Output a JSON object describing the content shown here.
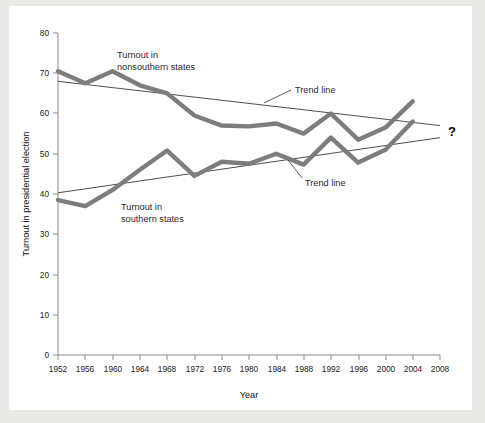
{
  "chart_data": {
    "type": "line",
    "title": "",
    "xlabel": "Year",
    "ylabel": "Turnout in presidential election",
    "x": [
      1952,
      1956,
      1960,
      1964,
      1968,
      1972,
      1976,
      1980,
      1984,
      1988,
      1992,
      1996,
      2000,
      2004
    ],
    "xlim": [
      1952,
      2008
    ],
    "ylim": [
      0,
      80
    ],
    "xticks": [
      "1952",
      "1956",
      "1960",
      "1964",
      "1968",
      "1972",
      "1976",
      "1980",
      "1984",
      "1988",
      "1992",
      "1996",
      "2000",
      "2004",
      "2008"
    ],
    "yticks": [
      "0",
      "10",
      "20",
      "30",
      "40",
      "50",
      "60",
      "70",
      "80"
    ],
    "grid": false,
    "legend": "none (inline annotations)",
    "series": [
      {
        "name": "Turnout in nonsouthern states",
        "color": "#7d7d7d",
        "values": [
          70.5,
          67.5,
          70.5,
          67.0,
          65.0,
          59.5,
          57.0,
          56.8,
          57.5,
          55.0,
          60.0,
          53.5,
          56.5,
          63.0
        ]
      },
      {
        "name": "Turnout in southern states",
        "color": "#7d7d7d",
        "values": [
          38.5,
          37.0,
          41.0,
          46.0,
          50.8,
          44.5,
          48.0,
          47.5,
          50.0,
          47.3,
          54.0,
          47.8,
          51.0,
          58.0
        ]
      }
    ],
    "trend_lines": [
      {
        "name": "Trend line (nonsouthern)",
        "x": [
          1952,
          2008
        ],
        "values": [
          68.0,
          57.0
        ],
        "color": "#1f1f1f"
      },
      {
        "name": "Trend line (southern)",
        "x": [
          1952,
          2008
        ],
        "values": [
          40.3,
          54.0
        ],
        "color": "#1f1f1f"
      }
    ],
    "annotations": [
      {
        "id": "nonsouthern-label",
        "text_line1": "Turnout in",
        "text_line2": "nonsouthern states"
      },
      {
        "id": "southern-label",
        "text_line1": "Turnout in",
        "text_line2": "southern states"
      },
      {
        "id": "trend-upper-label",
        "text": "Trend line"
      },
      {
        "id": "trend-lower-label",
        "text": "Trend line"
      },
      {
        "id": "future-question-mark",
        "text": "?"
      }
    ]
  }
}
